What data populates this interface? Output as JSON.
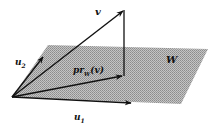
{
  "diagram": {
    "labels": {
      "v": "v",
      "u2_base": "u",
      "u2_sub": "2",
      "u1_base": "u",
      "u1_sub": "1",
      "proj_base": "pr",
      "proj_sub": "W",
      "proj_arg": "(v)",
      "plane": "W"
    },
    "colors": {
      "plane_fill": "#b8b8b8",
      "plane_dots": "#8c8c8c",
      "stroke": "#111111",
      "background": "#ffffff"
    },
    "geometry": {
      "origin": [
        12,
        97
      ],
      "v_tip": [
        124,
        10
      ],
      "proj_tip": [
        123,
        76
      ],
      "u1_tip": [
        132,
        103
      ],
      "u2_tip": [
        44,
        56
      ],
      "plane": [
        [
          12,
          97
        ],
        [
          48,
          45
        ],
        [
          208,
          49
        ],
        [
          181,
          104
        ]
      ]
    }
  }
}
